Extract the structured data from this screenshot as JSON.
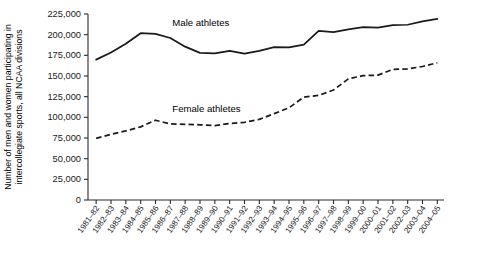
{
  "chart_data": {
    "type": "line",
    "title": "",
    "subtitle": "",
    "xlabel": "",
    "ylabel": "Number of men and women participating in intercollegiate sports, all NCAA divisions",
    "ylabel_lines": [
      "Number of men and women participating in",
      "intercollegiate sports, all NCAA divisions"
    ],
    "ylim": [
      0,
      225000
    ],
    "ytick_step": 25000,
    "grid": false,
    "legend_position": "inline-annotation",
    "categories": [
      "1981–82",
      "1982–83",
      "1983–84",
      "1984–85",
      "1985–86",
      "1986–87",
      "1987–88",
      "1988–89",
      "1989–90",
      "1990–91",
      "1991–92",
      "1992–93",
      "1993–94",
      "1994–95",
      "1995–96",
      "1996–97",
      "1997–98",
      "1998–99",
      "1999–00",
      "2000–01",
      "2001–02",
      "2002–03",
      "2003–04",
      "2004–05"
    ],
    "ytick_labels": [
      "0",
      "25,000",
      "50,000",
      "75,000",
      "100,000",
      "125,000",
      "150,000",
      "175,000",
      "200,000",
      "225,000"
    ],
    "ytick_values": [
      0,
      25000,
      50000,
      75000,
      100000,
      125000,
      150000,
      175000,
      200000,
      225000
    ],
    "series": [
      {
        "name": "Male athletes",
        "style": "solid",
        "color": "#1a1a1a",
        "label_text": "Male athletes",
        "values": [
          169800,
          178500,
          189000,
          201800,
          201000,
          196000,
          185500,
          178000,
          177500,
          180500,
          177000,
          180500,
          185000,
          184500,
          188000,
          204500,
          203000,
          206500,
          209000,
          208500,
          211500,
          212000,
          216000,
          219000
        ]
      },
      {
        "name": "Female athletes",
        "style": "dashed",
        "color": "#1a1a1a",
        "label_text": "Female athletes",
        "values": [
          74500,
          79500,
          83500,
          88500,
          96500,
          92000,
          91500,
          91000,
          90000,
          92500,
          94000,
          97500,
          104500,
          111500,
          124500,
          126500,
          133000,
          146500,
          150500,
          151000,
          158000,
          158500,
          161500,
          166000
        ]
      }
    ],
    "annotations": [
      {
        "text": "Male athletes",
        "series": "Male athletes",
        "x": "1986–87",
        "y": 210000
      },
      {
        "text": "Female athletes",
        "series": "Female athletes",
        "x": "1986–87",
        "y": 107000
      }
    ]
  },
  "figure": {
    "background_color": "#ffffff",
    "axis_color": "#2b2b2b",
    "text_color": "#1a1a1a"
  }
}
